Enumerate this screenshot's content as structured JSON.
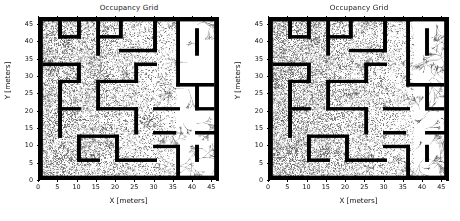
{
  "figure": {
    "width": 460,
    "height": 221,
    "background": "#ffffff",
    "panel_count": 2
  },
  "colors": {
    "wall": "#000000",
    "free_space": "#ffffff",
    "unknown_speckle": "#555555",
    "path_trace": "#3a3a3a",
    "axis": "#000000",
    "text": "#111111"
  },
  "panels": [
    {
      "id": "left",
      "title": "Occupancy Grid",
      "xlabel": "X [meters]",
      "ylabel": "Y [meters]",
      "xticks": [
        0,
        5,
        10,
        15,
        20,
        25,
        30,
        35,
        40,
        45
      ],
      "yticks": [
        0,
        5,
        10,
        15,
        20,
        25,
        30,
        35,
        40,
        45
      ],
      "xlim": [
        0,
        47
      ],
      "ylim": [
        0,
        47
      ]
    },
    {
      "id": "right",
      "title": "Occupancy Grid",
      "xlabel": "X [meters]",
      "ylabel": "Y [meters]",
      "xticks": [
        0,
        5,
        10,
        15,
        20,
        25,
        30,
        35,
        40,
        45
      ],
      "yticks": [
        0,
        5,
        10,
        15,
        20,
        25,
        30,
        35,
        40,
        45
      ],
      "xlim": [
        0,
        47
      ],
      "ylim": [
        0,
        47
      ]
    }
  ],
  "chart_data": {
    "type": "heatmap",
    "title": "Occupancy Grid",
    "xlabel": "X [meters]",
    "ylabel": "Y [meters]",
    "xlim": [
      0,
      47
    ],
    "ylim": [
      0,
      47
    ],
    "xticks": [
      0,
      5,
      10,
      15,
      20,
      25,
      30,
      35,
      40,
      45
    ],
    "yticks": [
      0,
      5,
      10,
      15,
      20,
      25,
      30,
      35,
      40,
      45
    ],
    "grid": false,
    "legend": null,
    "subplots": [
      {
        "index": 0,
        "position": "left",
        "title": "Occupancy Grid",
        "description": "Occupancy grid map of a maze environment. Black cells are occupied walls, white cells are known free space, speckled gray cells are unexplored/uncertain, thin dark curves are sampled exploration tree branches.",
        "explored_region": {
          "comment": "Speckled uncertainty covers the left and central portion; right-hand corridors are largely cleared to white.",
          "speckle_xrange": [
            0,
            36
          ],
          "speckle_yrange": [
            0,
            47
          ],
          "cleared_xrange": [
            36,
            47
          ]
        },
        "boundary_walls": [
          {
            "x": 0,
            "y": 0,
            "w": 47,
            "h": 1
          },
          {
            "x": 0,
            "y": 46,
            "w": 47,
            "h": 1
          },
          {
            "x": 0,
            "y": 0,
            "w": 1,
            "h": 47
          },
          {
            "x": 46,
            "y": 0,
            "w": 1,
            "h": 47
          }
        ],
        "interior_walls": [
          {
            "x": 5,
            "y": 41,
            "w": 1,
            "h": 5
          },
          {
            "x": 10,
            "y": 41,
            "w": 1,
            "h": 6
          },
          {
            "x": 5,
            "y": 41,
            "w": 6,
            "h": 1
          },
          {
            "x": 15,
            "y": 36,
            "w": 1,
            "h": 11
          },
          {
            "x": 15,
            "y": 41,
            "w": 6,
            "h": 1
          },
          {
            "x": 21,
            "y": 41,
            "w": 1,
            "h": 6
          },
          {
            "x": 21,
            "y": 37,
            "w": 10,
            "h": 1
          },
          {
            "x": 30,
            "y": 37,
            "w": 1,
            "h": 10
          },
          {
            "x": 36,
            "y": 27,
            "w": 1,
            "h": 20
          },
          {
            "x": 41,
            "y": 36,
            "w": 1,
            "h": 8
          },
          {
            "x": 1,
            "y": 33,
            "w": 9,
            "h": 1
          },
          {
            "x": 10,
            "y": 28,
            "w": 1,
            "h": 6
          },
          {
            "x": 5,
            "y": 28,
            "w": 6,
            "h": 1
          },
          {
            "x": 15,
            "y": 28,
            "w": 11,
            "h": 1
          },
          {
            "x": 25,
            "y": 28,
            "w": 1,
            "h": 6
          },
          {
            "x": 25,
            "y": 33,
            "w": 6,
            "h": 1
          },
          {
            "x": 36,
            "y": 27,
            "w": 10,
            "h": 1
          },
          {
            "x": 5,
            "y": 20,
            "w": 1,
            "h": 8
          },
          {
            "x": 5,
            "y": 20,
            "w": 6,
            "h": 1
          },
          {
            "x": 15,
            "y": 20,
            "w": 1,
            "h": 9
          },
          {
            "x": 15,
            "y": 20,
            "w": 11,
            "h": 1
          },
          {
            "x": 25,
            "y": 13,
            "w": 1,
            "h": 8
          },
          {
            "x": 30,
            "y": 20,
            "w": 7,
            "h": 1
          },
          {
            "x": 41,
            "y": 20,
            "w": 1,
            "h": 8
          },
          {
            "x": 41,
            "y": 20,
            "w": 5,
            "h": 1
          },
          {
            "x": 5,
            "y": 12,
            "w": 1,
            "h": 8
          },
          {
            "x": 10,
            "y": 12,
            "w": 11,
            "h": 1
          },
          {
            "x": 30,
            "y": 13,
            "w": 6,
            "h": 1
          },
          {
            "x": 41,
            "y": 13,
            "w": 6,
            "h": 1
          },
          {
            "x": 10,
            "y": 5,
            "w": 1,
            "h": 8
          },
          {
            "x": 10,
            "y": 5,
            "w": 6,
            "h": 1
          },
          {
            "x": 20,
            "y": 5,
            "w": 1,
            "h": 8
          },
          {
            "x": 20,
            "y": 5,
            "w": 11,
            "h": 1
          },
          {
            "x": 30,
            "y": 9,
            "w": 7,
            "h": 1
          },
          {
            "x": 36,
            "y": 1,
            "w": 1,
            "h": 9
          },
          {
            "x": 41,
            "y": 5,
            "w": 1,
            "h": 5
          }
        ]
      },
      {
        "index": 1,
        "position": "right",
        "title": "Occupancy Grid",
        "description": "Second occupancy grid of the same maze at a different exploration stage. Speckled uncertainty is denser over the left two-thirds; the right corridors show long thin sampled path traces.",
        "explored_region": {
          "comment": "Dense speckle across the left and middle; right-hand region mostly white with traced branches.",
          "speckle_xrange": [
            0,
            38
          ],
          "speckle_yrange": [
            0,
            47
          ],
          "cleared_xrange": [
            38,
            47
          ]
        },
        "boundary_walls": [
          {
            "x": 0,
            "y": 0,
            "w": 47,
            "h": 1
          },
          {
            "x": 0,
            "y": 46,
            "w": 47,
            "h": 1
          },
          {
            "x": 0,
            "y": 0,
            "w": 1,
            "h": 47
          },
          {
            "x": 46,
            "y": 0,
            "w": 1,
            "h": 47
          }
        ],
        "interior_walls": [
          {
            "x": 5,
            "y": 41,
            "w": 1,
            "h": 5
          },
          {
            "x": 10,
            "y": 41,
            "w": 1,
            "h": 6
          },
          {
            "x": 5,
            "y": 41,
            "w": 6,
            "h": 1
          },
          {
            "x": 15,
            "y": 36,
            "w": 1,
            "h": 11
          },
          {
            "x": 15,
            "y": 41,
            "w": 6,
            "h": 1
          },
          {
            "x": 21,
            "y": 41,
            "w": 1,
            "h": 6
          },
          {
            "x": 21,
            "y": 37,
            "w": 10,
            "h": 1
          },
          {
            "x": 30,
            "y": 37,
            "w": 1,
            "h": 10
          },
          {
            "x": 36,
            "y": 27,
            "w": 1,
            "h": 20
          },
          {
            "x": 41,
            "y": 36,
            "w": 1,
            "h": 8
          },
          {
            "x": 1,
            "y": 33,
            "w": 9,
            "h": 1
          },
          {
            "x": 10,
            "y": 28,
            "w": 1,
            "h": 6
          },
          {
            "x": 5,
            "y": 28,
            "w": 6,
            "h": 1
          },
          {
            "x": 15,
            "y": 28,
            "w": 11,
            "h": 1
          },
          {
            "x": 25,
            "y": 28,
            "w": 1,
            "h": 6
          },
          {
            "x": 25,
            "y": 33,
            "w": 6,
            "h": 1
          },
          {
            "x": 36,
            "y": 27,
            "w": 10,
            "h": 1
          },
          {
            "x": 5,
            "y": 20,
            "w": 1,
            "h": 8
          },
          {
            "x": 5,
            "y": 20,
            "w": 6,
            "h": 1
          },
          {
            "x": 15,
            "y": 20,
            "w": 1,
            "h": 9
          },
          {
            "x": 15,
            "y": 20,
            "w": 11,
            "h": 1
          },
          {
            "x": 25,
            "y": 13,
            "w": 1,
            "h": 8
          },
          {
            "x": 30,
            "y": 20,
            "w": 7,
            "h": 1
          },
          {
            "x": 41,
            "y": 20,
            "w": 1,
            "h": 8
          },
          {
            "x": 41,
            "y": 20,
            "w": 5,
            "h": 1
          },
          {
            "x": 5,
            "y": 12,
            "w": 1,
            "h": 8
          },
          {
            "x": 10,
            "y": 12,
            "w": 11,
            "h": 1
          },
          {
            "x": 30,
            "y": 13,
            "w": 6,
            "h": 1
          },
          {
            "x": 41,
            "y": 13,
            "w": 6,
            "h": 1
          },
          {
            "x": 10,
            "y": 5,
            "w": 1,
            "h": 8
          },
          {
            "x": 10,
            "y": 5,
            "w": 6,
            "h": 1
          },
          {
            "x": 20,
            "y": 5,
            "w": 1,
            "h": 8
          },
          {
            "x": 20,
            "y": 5,
            "w": 11,
            "h": 1
          },
          {
            "x": 30,
            "y": 9,
            "w": 7,
            "h": 1
          },
          {
            "x": 36,
            "y": 1,
            "w": 1,
            "h": 9
          },
          {
            "x": 41,
            "y": 5,
            "w": 1,
            "h": 5
          }
        ]
      }
    ]
  }
}
